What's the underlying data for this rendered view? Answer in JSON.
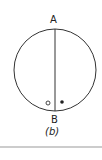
{
  "figure": {
    "top_label": "A",
    "bottom_label": "B",
    "caption": "(b)",
    "elements": {
      "circle": {
        "cx": 55,
        "cy": 70,
        "r": 41,
        "stroke": "#333333"
      },
      "chord": {
        "from": "A",
        "to": "B",
        "orientation": "vertical"
      },
      "open_marker": {
        "shape": "open-circle",
        "x": 48,
        "y": 103
      },
      "filled_marker": {
        "shape": "filled-dot",
        "x": 62,
        "y": 102
      }
    }
  }
}
